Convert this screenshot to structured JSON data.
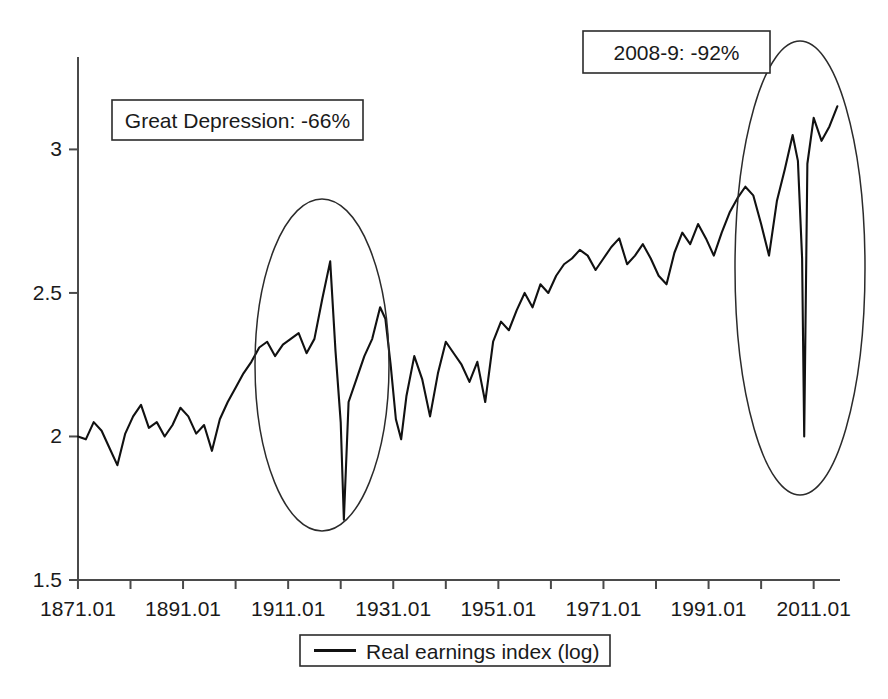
{
  "chart_data": {
    "type": "line",
    "title": "",
    "xlabel": "",
    "ylabel": "",
    "grid": false,
    "legend_position": "bottom",
    "xlim": [
      1871.01,
      2016.01
    ],
    "ylim": [
      1.5,
      3.2
    ],
    "y_ticks": [
      "1.5",
      "2",
      "2.5",
      "3"
    ],
    "y_tick_values": [
      1.5,
      2.0,
      2.5,
      3.0
    ],
    "x_ticks": [
      "1871.01",
      "1891.01",
      "1911.01",
      "1931.01",
      "1951.01",
      "1971.01",
      "1991.01",
      "2011.01"
    ],
    "x_tick_values": [
      1871,
      1891,
      1911,
      1931,
      1951,
      1971,
      1991,
      2011
    ],
    "x_minor_interval_years": 10,
    "series": [
      {
        "name": "Real earnings index (log)",
        "color": "#111111",
        "x": [
          1871.0,
          1872.5,
          1874.0,
          1875.5,
          1877.0,
          1878.5,
          1880.0,
          1881.5,
          1883.0,
          1884.5,
          1886.0,
          1887.5,
          1889.0,
          1890.5,
          1892.0,
          1893.5,
          1895.0,
          1896.5,
          1898.0,
          1899.5,
          1901.0,
          1902.5,
          1904.0,
          1905.5,
          1907.0,
          1908.5,
          1910.0,
          1911.5,
          1913.0,
          1914.5,
          1916.0,
          1917.5,
          1919.0,
          1920.0,
          1921.0,
          1921.6,
          1922.5,
          1924.0,
          1925.5,
          1927.0,
          1928.5,
          1929.5,
          1930.5,
          1931.5,
          1932.5,
          1933.5,
          1935.0,
          1936.5,
          1938.0,
          1939.5,
          1941.0,
          1942.5,
          1944.0,
          1945.5,
          1947.0,
          1948.5,
          1950.0,
          1951.5,
          1953.0,
          1954.5,
          1956.0,
          1957.5,
          1959.0,
          1960.5,
          1962.0,
          1963.5,
          1965.0,
          1966.5,
          1968.0,
          1969.5,
          1971.0,
          1972.5,
          1974.0,
          1975.5,
          1977.0,
          1978.5,
          1980.0,
          1981.5,
          1983.0,
          1984.5,
          1986.0,
          1987.5,
          1989.0,
          1990.5,
          1992.0,
          1993.5,
          1995.0,
          1996.5,
          1998.0,
          1999.5,
          2001.0,
          2002.5,
          2004.0,
          2005.5,
          2007.0,
          2008.0,
          2008.8,
          2009.2,
          2009.8,
          2011.0,
          2012.5,
          2014.0,
          2015.5
        ],
        "values": [
          2.0,
          1.99,
          2.05,
          2.02,
          1.96,
          1.9,
          2.01,
          2.07,
          2.11,
          2.03,
          2.05,
          2.0,
          2.04,
          2.1,
          2.07,
          2.01,
          2.04,
          1.95,
          2.06,
          2.12,
          2.17,
          2.22,
          2.26,
          2.31,
          2.33,
          2.28,
          2.32,
          2.34,
          2.36,
          2.29,
          2.34,
          2.48,
          2.61,
          2.3,
          2.05,
          1.71,
          2.12,
          2.2,
          2.28,
          2.34,
          2.45,
          2.41,
          2.25,
          2.06,
          1.99,
          2.14,
          2.28,
          2.2,
          2.07,
          2.22,
          2.33,
          2.29,
          2.25,
          2.19,
          2.26,
          2.12,
          2.33,
          2.4,
          2.37,
          2.44,
          2.5,
          2.45,
          2.53,
          2.5,
          2.56,
          2.6,
          2.62,
          2.65,
          2.63,
          2.58,
          2.62,
          2.66,
          2.69,
          2.6,
          2.63,
          2.67,
          2.62,
          2.56,
          2.53,
          2.64,
          2.71,
          2.67,
          2.74,
          2.69,
          2.63,
          2.71,
          2.78,
          2.83,
          2.87,
          2.84,
          2.74,
          2.63,
          2.82,
          2.93,
          3.05,
          2.96,
          2.62,
          2.0,
          2.95,
          3.11,
          3.03,
          3.08,
          3.15
        ],
        "legend_label": "Real earnings index (log)"
      }
    ],
    "annotations": [
      {
        "id": "great-depression",
        "text": "Great Depression: -66%",
        "box": {
          "x": 112,
          "y": 100,
          "width": 251,
          "height": 40
        },
        "ellipse": {
          "cx": 322,
          "cy": 365,
          "rx": 67,
          "ry": 166
        }
      },
      {
        "id": "crisis-2008",
        "text": "2008-9: -92%",
        "box": {
          "x": 583,
          "y": 31,
          "width": 187,
          "height": 42
        },
        "ellipse": {
          "cx": 800,
          "cy": 268,
          "rx": 65,
          "ry": 227
        }
      }
    ],
    "legend": {
      "label": "Real earnings index (log)",
      "box": {
        "x": 300,
        "y": 635,
        "width": 310,
        "height": 31
      }
    }
  }
}
